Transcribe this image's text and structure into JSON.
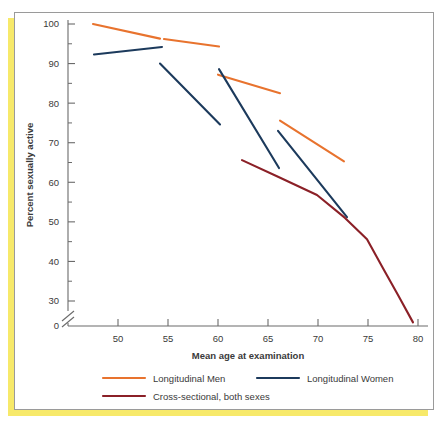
{
  "chart_data": {
    "type": "line",
    "title": "",
    "xlabel": "Mean age at examination",
    "ylabel": "Percent sexually active",
    "xlim": [
      45,
      81
    ],
    "ylim": [
      0,
      100
    ],
    "y_axis_break": true,
    "y_break_between": [
      0,
      30
    ],
    "grid": false,
    "legend_position": "bottom",
    "xticks": [
      50,
      55,
      60,
      65,
      70,
      75,
      80
    ],
    "xtick_labels": [
      "50",
      "55",
      "60",
      "65",
      "70",
      "75",
      "80"
    ],
    "yticks": [
      0,
      30,
      40,
      50,
      60,
      70,
      80,
      90,
      100
    ],
    "ytick_labels": [
      "0",
      "30",
      "40",
      "50",
      "60",
      "70",
      "80",
      "90",
      "100"
    ],
    "series": [
      {
        "name": "Longitudinal Men",
        "color": "#E8732E",
        "style": "segments",
        "segments": [
          {
            "points": [
              [
                47.5,
                100.0
              ],
              [
                54.2,
                96.3
              ]
            ]
          },
          {
            "points": [
              [
                54.6,
                96.2
              ],
              [
                60.1,
                94.3
              ]
            ]
          },
          {
            "points": [
              [
                60.0,
                87.2
              ],
              [
                66.2,
                82.5
              ]
            ]
          },
          {
            "points": [
              [
                66.2,
                75.6
              ],
              [
                72.6,
                65.3
              ]
            ]
          }
        ]
      },
      {
        "name": "Longitudinal Women",
        "color": "#1C3A5C",
        "style": "segments",
        "segments": [
          {
            "points": [
              [
                47.6,
                92.3
              ],
              [
                54.4,
                94.2
              ]
            ]
          },
          {
            "points": [
              [
                54.2,
                90.0
              ],
              [
                60.2,
                74.6
              ]
            ]
          },
          {
            "points": [
              [
                60.1,
                88.6
              ],
              [
                66.1,
                63.6
              ]
            ]
          },
          {
            "points": [
              [
                66.0,
                73.0
              ],
              [
                72.9,
                51.2
              ]
            ]
          }
        ]
      },
      {
        "name": "Cross-sectional, both sexes",
        "color": "#8B2027",
        "style": "curve",
        "segments": [
          {
            "points": [
              [
                62.4,
                65.6
              ],
              [
                66.0,
                61.4
              ],
              [
                69.9,
                56.8
              ],
              [
                72.7,
                51.0
              ],
              [
                74.9,
                45.6
              ],
              [
                76.5,
                38.3
              ],
              [
                78.0,
                31.5
              ],
              [
                79.5,
                24.6
              ]
            ]
          }
        ]
      }
    ],
    "legend": [
      {
        "label": "Longitudinal Men",
        "color": "#E8732E"
      },
      {
        "label": "Longitudinal Women",
        "color": "#1C3A5C"
      },
      {
        "label": "Cross-sectional, both sexes",
        "color": "#8B2027"
      }
    ]
  }
}
